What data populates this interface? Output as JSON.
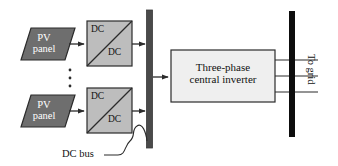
{
  "diagram": {
    "colors": {
      "pv_panel_fill": "#6e6e6e",
      "pv_panel_stroke": "#2b2b2b",
      "converter_fill": "#bdbdbd",
      "converter_stroke": "#2b2b2b",
      "inverter_fill": "#efefef",
      "inverter_stroke": "#2b2b2b",
      "dc_bus_fill": "#4a4a4a",
      "grid_bus_fill": "#0d0d0d",
      "line": "#2b2b2b",
      "background": "#ffffff",
      "pv_text": "#ffffff",
      "text": "#111111"
    },
    "pv_panels": [
      {
        "line1": "PV",
        "line2": "panel"
      },
      {
        "line1": "PV",
        "line2": "panel"
      }
    ],
    "converters": [
      {
        "top_label": "DC",
        "bottom_label": "DC"
      },
      {
        "top_label": "DC",
        "bottom_label": "DC"
      }
    ],
    "inverter": {
      "line1": "Three-phase",
      "line2": "central inverter"
    },
    "dc_bus_label": "DC bus",
    "grid_label": "To grid",
    "ellipsis_dots": 3,
    "grid_phase_lines": 3
  }
}
